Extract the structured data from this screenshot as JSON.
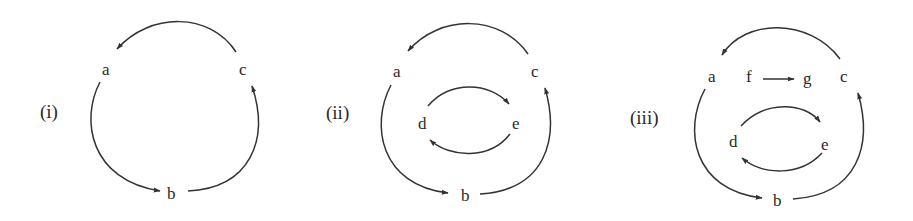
{
  "colors": {
    "ink": "#2a2a2a",
    "edge": "#333333",
    "background": "#ffffff"
  },
  "diagrams": [
    {
      "label": "(i)",
      "nodes": {
        "a": "a",
        "b": "b",
        "c": "c"
      },
      "edges": [
        [
          "c",
          "a"
        ],
        [
          "a",
          "b"
        ],
        [
          "b",
          "c"
        ]
      ]
    },
    {
      "label": "(ii)",
      "nodes": {
        "a": "a",
        "b": "b",
        "c": "c",
        "d": "d",
        "e": "e"
      },
      "edges": [
        [
          "c",
          "a"
        ],
        [
          "a",
          "b"
        ],
        [
          "b",
          "c"
        ],
        [
          "d",
          "e"
        ],
        [
          "e",
          "d"
        ]
      ]
    },
    {
      "label": "(iii)",
      "nodes": {
        "a": "a",
        "b": "b",
        "c": "c",
        "d": "d",
        "e": "e",
        "f": "f",
        "g": "g"
      },
      "edges": [
        [
          "c",
          "a"
        ],
        [
          "a",
          "b"
        ],
        [
          "b",
          "c"
        ],
        [
          "d",
          "e"
        ],
        [
          "e",
          "d"
        ],
        [
          "f",
          "g"
        ]
      ]
    }
  ]
}
